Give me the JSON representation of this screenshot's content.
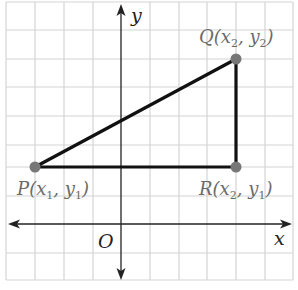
{
  "diagram": {
    "type": "coordinate-plane-right-triangle",
    "grid": {
      "spacing_px": 29,
      "color": "#d4d4d4"
    },
    "axes": {
      "x_label": "x",
      "y_label": "y",
      "origin_label": "O",
      "color": "#222222"
    },
    "points": [
      {
        "id": "P",
        "name": "P",
        "x_sub": "1",
        "y_sub": "1",
        "px": 35,
        "py": 167
      },
      {
        "id": "Q",
        "name": "Q",
        "x_sub": "2",
        "y_sub": "2",
        "px": 236,
        "py": 59
      },
      {
        "id": "R",
        "name": "R",
        "x_sub": "2",
        "y_sub": "1",
        "px": 236,
        "py": 167
      }
    ],
    "segments": [
      [
        "P",
        "Q"
      ],
      [
        "P",
        "R"
      ],
      [
        "Q",
        "R"
      ]
    ],
    "colors": {
      "segment": "#111111",
      "point": "#777777",
      "label": "#6b6b6b"
    }
  }
}
